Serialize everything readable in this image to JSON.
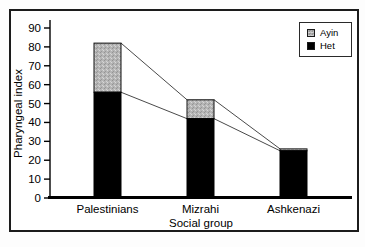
{
  "figure": {
    "background": "#ffffff",
    "frame_border_color": "#1c1c1c"
  },
  "chart_data": {
    "type": "bar",
    "stacked": true,
    "title": "",
    "xlabel": "Social group",
    "ylabel": "Pharyngeal index",
    "categories": [
      "Palestinians",
      "Mizrahi",
      "Ashkenazi"
    ],
    "series": [
      {
        "name": "Het",
        "color": "#000000",
        "values": [
          56,
          42,
          25
        ]
      },
      {
        "name": "Ayin",
        "color": "#b5b5b5",
        "values": [
          26,
          10,
          1
        ]
      }
    ],
    "totals": [
      82,
      52,
      26
    ],
    "ylim": [
      0,
      90
    ],
    "yticks": [
      0,
      10,
      20,
      30,
      40,
      50,
      60,
      70,
      80,
      90
    ],
    "grid": false,
    "connector_lines": true,
    "connector_color": "#4a4a4a",
    "axis_color": "#000000",
    "legend": {
      "position": "top-right",
      "items": [
        {
          "label": "Ayin",
          "swatch": "stipple-gray"
        },
        {
          "label": "Het",
          "swatch": "black"
        }
      ]
    }
  }
}
